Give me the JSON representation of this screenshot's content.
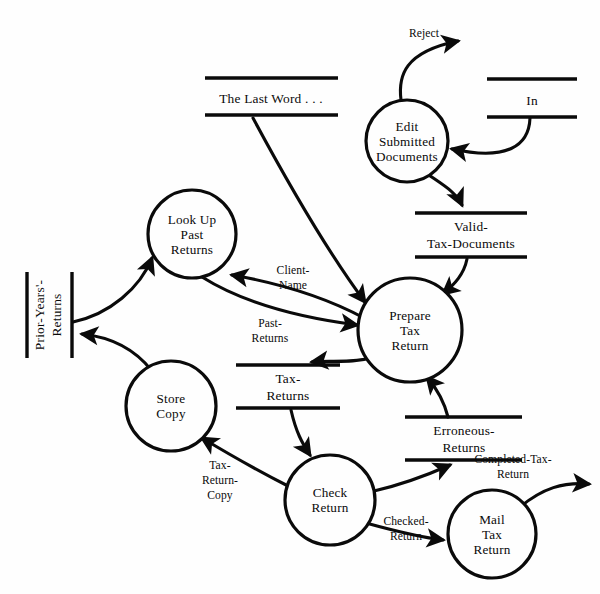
{
  "diagram": {
    "type": "data-flow-diagram",
    "caption": "",
    "line_color": "#0a0a0a",
    "background_color": "#fefefe",
    "processes": [
      {
        "id": "edit-submitted-documents",
        "lines": [
          "Edit",
          "Submitted",
          "Documents"
        ],
        "cx": 407,
        "cy": 141,
        "r": 41
      },
      {
        "id": "look-up-past-returns",
        "lines": [
          "Look Up",
          "Past",
          "Returns"
        ],
        "cx": 192,
        "cy": 234,
        "r": 44
      },
      {
        "id": "prepare-tax-return",
        "lines": [
          "Prepare",
          "Tax",
          "Return"
        ],
        "cx": 410,
        "cy": 330,
        "r": 52
      },
      {
        "id": "store-copy",
        "lines": [
          "Store",
          "Copy"
        ],
        "cx": 171,
        "cy": 406,
        "r": 45
      },
      {
        "id": "check-return",
        "lines": [
          "Check",
          "Return"
        ],
        "cx": 330,
        "cy": 500,
        "r": 45
      },
      {
        "id": "mail-tax-return",
        "lines": [
          "Mail",
          "Tax",
          "Return"
        ],
        "cx": 492,
        "cy": 534,
        "r": 44
      }
    ],
    "stores": [
      {
        "id": "the-last-word",
        "lines": [
          "The Last Word . . ."
        ],
        "orientation": "horizontal",
        "x1": 205,
        "x2": 338,
        "y_top": 78,
        "y_bottom": 115,
        "label_x": 271,
        "label_y": 103
      },
      {
        "id": "in",
        "lines": [
          "In"
        ],
        "orientation": "horizontal",
        "x1": 487,
        "x2": 577,
        "y_top": 79,
        "y_bottom": 117,
        "label_x": 532,
        "label_y": 105
      },
      {
        "id": "valid-tax-documents",
        "lines": [
          "Valid-",
          "Tax-Documents"
        ],
        "orientation": "horizontal",
        "x1": 415,
        "x2": 527,
        "y_top": 213,
        "y_bottom": 257,
        "label_x": 471,
        "label_y": 230
      },
      {
        "id": "prior-years-returns",
        "lines": [
          "Prior-Years'-",
          "Returns"
        ],
        "orientation": "vertical",
        "x1": 27,
        "x2": 72,
        "y_top": 272,
        "y_bottom": 358,
        "label_x": 50,
        "label_y": 315
      },
      {
        "id": "tax-returns",
        "lines": [
          "Tax-",
          "Returns"
        ],
        "orientation": "horizontal",
        "x1": 236,
        "x2": 340,
        "y_top": 365,
        "y_bottom": 408,
        "label_x": 288,
        "label_y": 382
      },
      {
        "id": "erroneous-returns",
        "lines": [
          "Erroneous-",
          "Returns"
        ],
        "orientation": "horizontal",
        "x1": 405,
        "x2": 522,
        "y_top": 417,
        "y_bottom": 460,
        "label_x": 464,
        "label_y": 434
      }
    ],
    "flows": [
      {
        "id": "reject",
        "label_lines": [
          "Reject"
        ],
        "label_x": 424,
        "label_y": 37,
        "from": "edit-submitted-documents",
        "to": "external-sink"
      },
      {
        "id": "in-to-edit",
        "label_lines": [],
        "label_x": 0,
        "label_y": 0,
        "from": "in",
        "to": "edit-submitted-documents"
      },
      {
        "id": "edit-to-valid",
        "label_lines": [],
        "label_x": 0,
        "label_y": 0,
        "from": "edit-submitted-documents",
        "to": "valid-tax-documents"
      },
      {
        "id": "valid-to-prepare",
        "label_lines": [],
        "label_x": 0,
        "label_y": 0,
        "from": "valid-tax-documents",
        "to": "prepare-tax-return"
      },
      {
        "id": "last-word-to-prepare",
        "label_lines": [],
        "label_x": 0,
        "label_y": 0,
        "from": "the-last-word",
        "to": "prepare-tax-return"
      },
      {
        "id": "client-name",
        "label_lines": [
          "Client-",
          "Name"
        ],
        "label_x": 293,
        "label_y": 274,
        "from": "prepare-tax-return",
        "to": "look-up-past-returns"
      },
      {
        "id": "past-returns",
        "label_lines": [
          "Past-",
          "Returns"
        ],
        "label_x": 270,
        "label_y": 327,
        "from": "look-up-past-returns",
        "to": "prepare-tax-return"
      },
      {
        "id": "prior-to-lookup",
        "label_lines": [],
        "label_x": 0,
        "label_y": 0,
        "from": "prior-years-returns",
        "to": "look-up-past-returns"
      },
      {
        "id": "store-to-prior",
        "label_lines": [],
        "label_x": 0,
        "label_y": 0,
        "from": "store-copy",
        "to": "prior-years-returns"
      },
      {
        "id": "prepare-to-tax",
        "label_lines": [],
        "label_x": 0,
        "label_y": 0,
        "from": "prepare-tax-return",
        "to": "tax-returns"
      },
      {
        "id": "tax-to-check",
        "label_lines": [],
        "label_x": 0,
        "label_y": 0,
        "from": "tax-returns",
        "to": "check-return"
      },
      {
        "id": "tax-return-copy",
        "label_lines": [
          "Tax-",
          "Return-",
          "Copy"
        ],
        "label_x": 220,
        "label_y": 469,
        "from": "check-return",
        "to": "store-copy"
      },
      {
        "id": "check-to-erroneous",
        "label_lines": [],
        "label_x": 0,
        "label_y": 0,
        "from": "check-return",
        "to": "erroneous-returns"
      },
      {
        "id": "erroneous-to-prepare",
        "label_lines": [],
        "label_x": 0,
        "label_y": 0,
        "from": "erroneous-returns",
        "to": "prepare-tax-return"
      },
      {
        "id": "checked-return",
        "label_lines": [
          "Checked-",
          "Return"
        ],
        "label_x": 406,
        "label_y": 519,
        "from": "check-return",
        "to": "mail-tax-return"
      },
      {
        "id": "completed-tax-return",
        "label_lines": [
          "Completed-Tax-",
          "Return"
        ],
        "label_x": 513,
        "label_y": 463,
        "from": "mail-tax-return",
        "to": "external-sink"
      }
    ]
  }
}
